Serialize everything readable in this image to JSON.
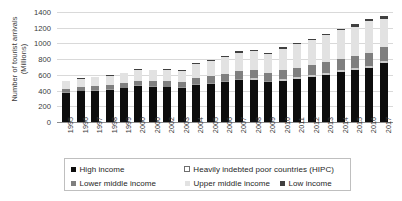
{
  "chart_data": {
    "type": "bar",
    "stacked": true,
    "title": "",
    "xlabel": "",
    "ylabel": "Number of tourist arrivals\n(Millions)",
    "ylim": [
      0,
      1400
    ],
    "ytick_step": 200,
    "yticks": [
      "1400",
      "1200",
      "1000",
      "800",
      "600",
      "400",
      "200",
      "0"
    ],
    "grid": true,
    "legend_position": "bottom",
    "categories": [
      "1995",
      "1996",
      "1997",
      "1998",
      "1999",
      "2000",
      "2000",
      "2002",
      "2003",
      "2004",
      "2005",
      "2006",
      "2007",
      "2008",
      "2009",
      "2010",
      "2011",
      "2012",
      "2013",
      "2014",
      "2015",
      "2016",
      "2017"
    ],
    "series": [
      {
        "name": "High income",
        "color": "#0d0d0d",
        "values": [
          372,
          389,
          399,
          410,
          428,
          459,
          447,
          441,
          432,
          470,
          489,
          511,
          538,
          540,
          506,
          527,
          553,
          575,
          604,
          637,
          661,
          692,
          745
        ]
      },
      {
        "name": "Heavily indebted poor countries (HIPC)",
        "color": "#ffffff",
        "values": [
          5,
          6,
          6,
          7,
          7,
          8,
          8,
          9,
          9,
          11,
          12,
          13,
          15,
          16,
          16,
          18,
          19,
          20,
          22,
          23,
          24,
          26,
          28
        ]
      },
      {
        "name": "Lower middle income",
        "color": "#7f7f7f",
        "values": [
          44,
          47,
          50,
          52,
          56,
          61,
          62,
          66,
          64,
          76,
          82,
          89,
          98,
          103,
          102,
          114,
          122,
          130,
          139,
          147,
          155,
          166,
          180
        ]
      },
      {
        "name": "Upper middle income",
        "color": "#e2e2e2",
        "values": [
          100,
          106,
          112,
          118,
          127,
          139,
          140,
          151,
          147,
          176,
          193,
          212,
          234,
          246,
          244,
          275,
          295,
          316,
          338,
          358,
          376,
          400,
          360
        ]
      },
      {
        "name": "Low income",
        "color": "#404040",
        "values": [
          6,
          6,
          7,
          7,
          8,
          9,
          9,
          10,
          10,
          12,
          13,
          14,
          16,
          17,
          17,
          19,
          20,
          22,
          24,
          25,
          27,
          29,
          31
        ]
      }
    ],
    "totals": [
      527,
      554,
      574,
      594,
      626,
      676,
      666,
      677,
      662,
      745,
      789,
      839,
      901,
      922,
      885,
      953,
      1009,
      1063,
      1127,
      1190,
      1243,
      1313,
      1344
    ]
  },
  "legend": {
    "row1": [
      {
        "label": "High income",
        "swatch": "swatch-high-income"
      },
      {
        "label": "Heavily indebted poor countries (HIPC)",
        "swatch": "swatch-hipc"
      }
    ],
    "row2": [
      {
        "label": "Lower middle income",
        "swatch": "swatch-lower-middle-income"
      },
      {
        "label": "Upper middle income",
        "swatch": "swatch-upper-middle-income"
      },
      {
        "label": "Low income",
        "swatch": "swatch-low-income"
      }
    ]
  }
}
